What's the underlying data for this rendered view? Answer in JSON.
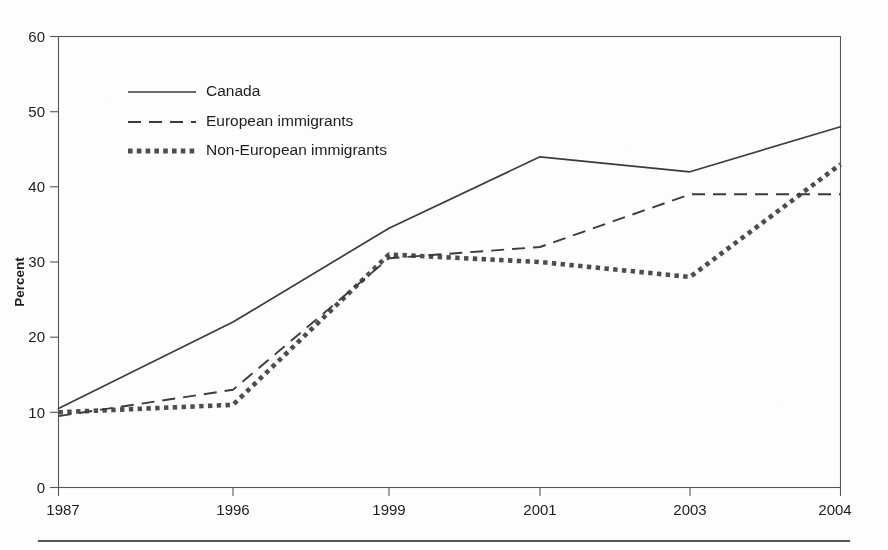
{
  "chart_data": {
    "type": "line",
    "title": "",
    "subtitle": "",
    "xlabel": "",
    "ylabel": "Percent",
    "categories": [
      "1987",
      "1996",
      "1999",
      "2001",
      "2003",
      "2004"
    ],
    "x": [
      1987,
      1996,
      1999,
      2001,
      2003,
      2004
    ],
    "xlim": [
      1987,
      2004
    ],
    "ylim": [
      0,
      60
    ],
    "yticks": [
      0,
      10,
      20,
      30,
      40,
      50,
      60
    ],
    "xticks": [
      "1987",
      "1996",
      "1999",
      "2001",
      "2003",
      "2004"
    ],
    "grid": false,
    "legend_position": "upper-left-inside",
    "series": [
      {
        "name": "Canada",
        "style": "solid",
        "color": "#3c3c3b",
        "values": [
          10.5,
          22,
          34.5,
          44,
          42,
          48
        ]
      },
      {
        "name": "European immigrants",
        "style": "dashed",
        "color": "#3c3c3b",
        "values": [
          9.5,
          13,
          30.5,
          32,
          39,
          39
        ]
      },
      {
        "name": "Non-European immigrants",
        "style": "dotted",
        "color": "#4d4d4c",
        "values": [
          10,
          11,
          31,
          30,
          28,
          43
        ]
      }
    ],
    "annotations": []
  },
  "legend": {
    "items": [
      {
        "label": "Canada",
        "style": "solid"
      },
      {
        "label": "European immigrants",
        "style": "dashed"
      },
      {
        "label": "Non-European immigrants",
        "style": "dotted"
      }
    ]
  },
  "axes": {
    "y_title": "Percent",
    "y_ticks": [
      "60",
      "50",
      "40",
      "30",
      "20",
      "10",
      "0"
    ],
    "x_ticks": [
      "1987",
      "1996",
      "1999",
      "2001",
      "2003",
      "2004"
    ]
  }
}
